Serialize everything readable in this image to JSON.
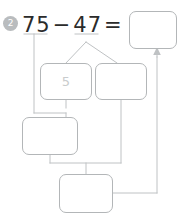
{
  "problem": {
    "number": "2",
    "equation": {
      "minuend": "75",
      "operator": "−",
      "subtrahend": "47",
      "equals": "="
    }
  },
  "boxes": {
    "answer": "",
    "mid_left": "5",
    "mid_right": "",
    "lower": "",
    "bottom": ""
  },
  "colors": {
    "badge_bg": "#b9bcbe",
    "badge_text": "#ffffff",
    "equation_text": "#2b2b2b",
    "box_border": "#b3b6b8",
    "box_fill": "#ffffff",
    "placeholder_text": "#c9cccd",
    "connector_line": "#bfc2c4"
  }
}
